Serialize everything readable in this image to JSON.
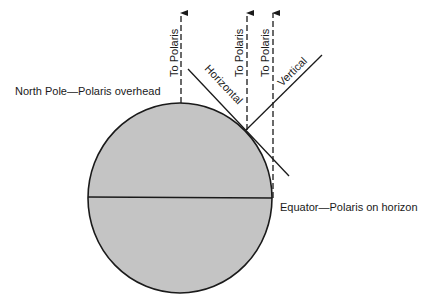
{
  "diagram": {
    "labels": {
      "north_pole": "North Pole—Polaris overhead",
      "equator": "Equator—Polaris on horizon",
      "to_polaris": "To Polaris",
      "horizontal": "Horizontal",
      "vertical": "Vertical"
    },
    "colors": {
      "earth_fill": "#c4c4c4",
      "line": "#1a1a1a",
      "background": "#ffffff"
    }
  }
}
